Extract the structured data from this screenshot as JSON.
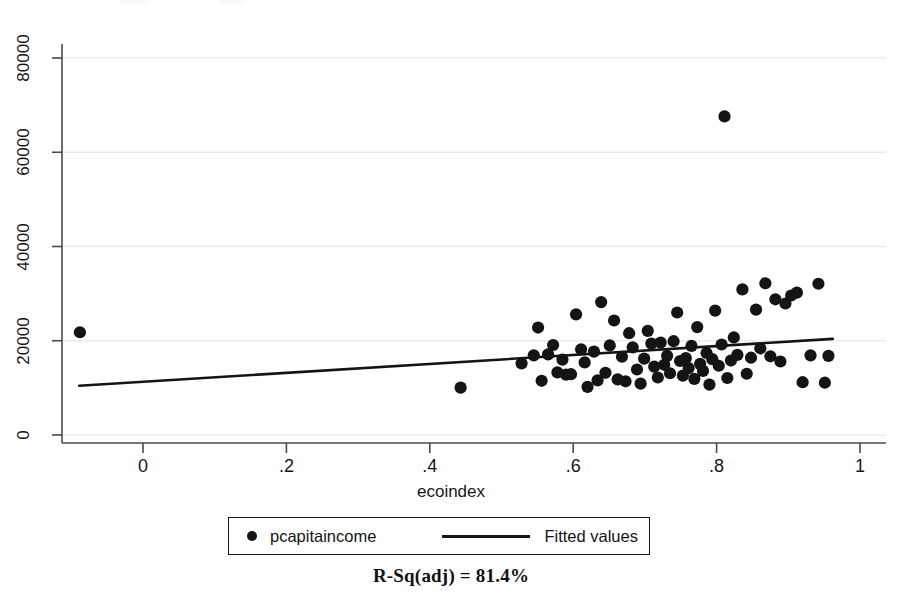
{
  "chart_data": {
    "type": "scatter",
    "title": "",
    "xlabel": "ecoindex",
    "ylabel": "",
    "xlim": [
      -0.105,
      1.035
    ],
    "ylim": [
      -5200,
      86000
    ],
    "xticks": [
      0,
      0.2,
      0.4,
      0.6,
      0.8,
      1
    ],
    "xtick_labels": [
      "0",
      ".2",
      ".4",
      ".6",
      ".8",
      "1"
    ],
    "yticks": [
      0,
      20000,
      40000,
      60000,
      80000
    ],
    "ytick_labels": [
      "0",
      "20000",
      "40000",
      "60000",
      "80000"
    ],
    "grid": "horizontal-faint",
    "legend_position": "below-axis",
    "series": [
      {
        "name": "pcapitaincome",
        "type": "scatter",
        "marker": "filled-circle",
        "color": "#141414",
        "points": [
          [
            -0.088,
            21800
          ],
          [
            0.443,
            10050
          ],
          [
            0.528,
            15200
          ],
          [
            0.545,
            16900
          ],
          [
            0.551,
            22800
          ],
          [
            0.556,
            11500
          ],
          [
            0.565,
            17100
          ],
          [
            0.572,
            19100
          ],
          [
            0.578,
            13300
          ],
          [
            0.585,
            16000
          ],
          [
            0.59,
            12800
          ],
          [
            0.597,
            12900
          ],
          [
            0.604,
            25600
          ],
          [
            0.611,
            18200
          ],
          [
            0.616,
            15400
          ],
          [
            0.62,
            10200
          ],
          [
            0.629,
            17700
          ],
          [
            0.634,
            11600
          ],
          [
            0.639,
            28200
          ],
          [
            0.645,
            13200
          ],
          [
            0.651,
            19000
          ],
          [
            0.657,
            24300
          ],
          [
            0.662,
            11800
          ],
          [
            0.668,
            16600
          ],
          [
            0.673,
            11400
          ],
          [
            0.678,
            21600
          ],
          [
            0.683,
            18600
          ],
          [
            0.689,
            13900
          ],
          [
            0.694,
            10900
          ],
          [
            0.699,
            16200
          ],
          [
            0.704,
            22100
          ],
          [
            0.709,
            19400
          ],
          [
            0.713,
            14500
          ],
          [
            0.718,
            12200
          ],
          [
            0.722,
            19600
          ],
          [
            0.727,
            14900
          ],
          [
            0.731,
            16800
          ],
          [
            0.735,
            13100
          ],
          [
            0.74,
            19900
          ],
          [
            0.745,
            26000
          ],
          [
            0.749,
            15700
          ],
          [
            0.753,
            12600
          ],
          [
            0.757,
            16300
          ],
          [
            0.761,
            14200
          ],
          [
            0.765,
            18900
          ],
          [
            0.769,
            11900
          ],
          [
            0.773,
            22900
          ],
          [
            0.777,
            15100
          ],
          [
            0.781,
            13600
          ],
          [
            0.786,
            17400
          ],
          [
            0.79,
            10700
          ],
          [
            0.794,
            16100
          ],
          [
            0.798,
            26400
          ],
          [
            0.803,
            14700
          ],
          [
            0.807,
            19200
          ],
          [
            0.811,
            67600
          ],
          [
            0.815,
            12100
          ],
          [
            0.82,
            15800
          ],
          [
            0.824,
            20700
          ],
          [
            0.829,
            17000
          ],
          [
            0.836,
            30900
          ],
          [
            0.842,
            13000
          ],
          [
            0.848,
            16400
          ],
          [
            0.855,
            26600
          ],
          [
            0.861,
            18400
          ],
          [
            0.868,
            32200
          ],
          [
            0.875,
            16700
          ],
          [
            0.882,
            28800
          ],
          [
            0.889,
            15600
          ],
          [
            0.896,
            27900
          ],
          [
            0.904,
            29600
          ],
          [
            0.912,
            30200
          ],
          [
            0.92,
            11200
          ],
          [
            0.931,
            16900
          ],
          [
            0.942,
            32100
          ],
          [
            0.951,
            11100
          ],
          [
            0.956,
            16800
          ]
        ]
      },
      {
        "name": "Fitted values",
        "type": "line",
        "color": "#141414",
        "endpoints": [
          [
            -0.089,
            10450
          ],
          [
            0.962,
            20400
          ]
        ],
        "slope": 9470,
        "intercept": 11290
      }
    ],
    "annotations": [
      {
        "name": "r-squared-adjusted",
        "text": "R-Sq(adj) = 81.4%",
        "value": 81.4
      }
    ]
  },
  "axes": {
    "x": {
      "title": "ecoindex",
      "ticks": [
        {
          "label": "0",
          "value": 0
        },
        {
          "label": ".2",
          "value": 0.2
        },
        {
          "label": ".4",
          "value": 0.4
        },
        {
          "label": ".6",
          "value": 0.6
        },
        {
          "label": ".8",
          "value": 0.8
        },
        {
          "label": "1",
          "value": 1
        }
      ]
    },
    "y": {
      "title": "",
      "ticks": [
        {
          "label": "0",
          "value": 0
        },
        {
          "label": "20000",
          "value": 20000
        },
        {
          "label": "40000",
          "value": 40000
        },
        {
          "label": "60000",
          "value": 60000
        },
        {
          "label": "80000",
          "value": 80000
        }
      ]
    }
  },
  "legend": {
    "entries": [
      {
        "label": "pcapitaincome",
        "marker": "dot"
      },
      {
        "label": "Fitted values",
        "marker": "line"
      }
    ]
  },
  "caption": {
    "text": "R-Sq(adj) = 81.4%"
  },
  "colors": {
    "ink": "#141414",
    "axis": "#3a3a3a",
    "grid": "#ececec",
    "background": "#ffffff"
  }
}
